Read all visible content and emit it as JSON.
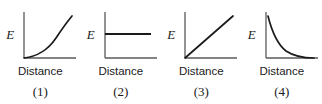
{
  "figure": {
    "background_color": "#ffffff",
    "ink_color": "#1a1a1a",
    "axis_color": "#5a5a5a",
    "panels": [
      {
        "number_label": "(1)",
        "y_axis_label": "E",
        "x_axis_label": "Distance",
        "curve_shape": "exponential-increase",
        "curve_path": "M 22 52 C 34 51, 46 44, 54 32 C 60 23, 65 16, 70 10"
      },
      {
        "number_label": "(2)",
        "y_axis_label": "E",
        "x_axis_label": "Distance",
        "curve_shape": "constant-horizontal",
        "curve_path": "M 22 28 L 68 28"
      },
      {
        "number_label": "(3)",
        "y_axis_label": "E",
        "x_axis_label": "Distance",
        "curve_shape": "linear-increase",
        "curve_path": "M 22 52 L 70 10"
      },
      {
        "number_label": "(4)",
        "y_axis_label": "E",
        "x_axis_label": "Distance",
        "curve_shape": "inverse-decay",
        "curve_path": "M 24 10 C 28 26, 33 38, 42 45 C 51 51, 61 52, 70 52"
      }
    ]
  },
  "chart_data": {
    "type": "line",
    "title": "",
    "xlabel": "Distance",
    "ylabel": "E",
    "grid": false,
    "legend": "none",
    "xlim": [
      0,
      1
    ],
    "ylim": [
      0,
      1
    ],
    "charts": [
      {
        "label": "(1)",
        "relationship": "E increases exponentially with distance",
        "x": [
          0.0,
          0.125,
          0.25,
          0.375,
          0.5,
          0.625,
          0.75,
          0.875,
          1.0
        ],
        "y": [
          0.0,
          0.02,
          0.06,
          0.12,
          0.21,
          0.34,
          0.52,
          0.74,
          1.0
        ]
      },
      {
        "label": "(2)",
        "relationship": "E remains constant as distance increases",
        "x": [
          0.0,
          0.25,
          0.5,
          0.75,
          1.0
        ],
        "y": [
          0.57,
          0.57,
          0.57,
          0.57,
          0.57
        ]
      },
      {
        "label": "(3)",
        "relationship": "E increases linearly with distance",
        "x": [
          0.0,
          0.25,
          0.5,
          0.75,
          1.0
        ],
        "y": [
          0.0,
          0.25,
          0.5,
          0.75,
          1.0
        ]
      },
      {
        "label": "(4)",
        "relationship": "E decreases with distance, approaching zero",
        "x": [
          0.0,
          0.125,
          0.25,
          0.375,
          0.5,
          0.625,
          0.75,
          0.875,
          1.0
        ],
        "y": [
          1.0,
          0.62,
          0.4,
          0.27,
          0.18,
          0.12,
          0.07,
          0.04,
          0.02
        ]
      }
    ]
  }
}
